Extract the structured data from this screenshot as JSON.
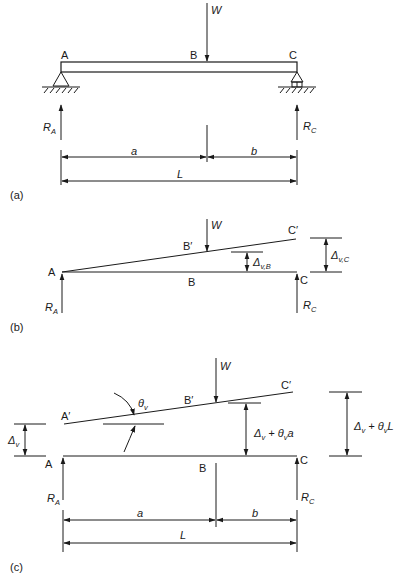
{
  "figure": {
    "panels": [
      {
        "id": "a",
        "caption": "(a)",
        "points": {
          "A": "A",
          "B": "B",
          "C": "C"
        },
        "load": "W",
        "reactions": {
          "left": {
            "main": "R",
            "sub": "A"
          },
          "right": {
            "main": "R",
            "sub": "C"
          }
        },
        "dimensions": {
          "a": "a",
          "b": "b",
          "L": "L"
        }
      },
      {
        "id": "b",
        "caption": "(b)",
        "points": {
          "A": "A",
          "B": "B",
          "C": "C",
          "B_prime": "B′",
          "C_prime": "C′"
        },
        "load": "W",
        "reactions": {
          "left": {
            "main": "R",
            "sub": "A"
          },
          "right": {
            "main": "R",
            "sub": "C"
          }
        },
        "deflections": {
          "at_B": {
            "main": "Δ",
            "sub": "v,B"
          },
          "at_C": {
            "main": "Δ",
            "sub": "v,C"
          }
        }
      },
      {
        "id": "c",
        "caption": "(c)",
        "points": {
          "A": "A",
          "B": "B",
          "C": "C",
          "A_prime": "A′",
          "B_prime": "B′",
          "C_prime": "C′"
        },
        "load": "W",
        "rotation": {
          "main": "θ",
          "sub": "v"
        },
        "reactions": {
          "left": {
            "main": "R",
            "sub": "A"
          },
          "right": {
            "main": "R",
            "sub": "C"
          }
        },
        "deflections": {
          "at_A": {
            "main": "Δ",
            "sub": "v"
          },
          "at_B": {
            "p1": "Δ",
            "s1": "v",
            "p2": " + θ",
            "s2": "v",
            "p3": "a"
          },
          "at_C": {
            "p1": "Δ",
            "s1": "v",
            "p2": " + θ",
            "s2": "v",
            "p3": "L"
          }
        },
        "dimensions": {
          "a": "a",
          "b": "b",
          "L": "L"
        }
      }
    ]
  }
}
